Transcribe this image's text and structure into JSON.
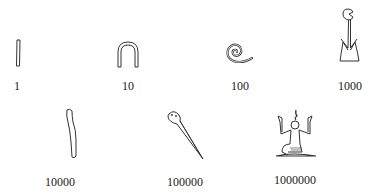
{
  "numerals": [
    {
      "value": "1",
      "glyph": "stroke-icon",
      "description": "single vertical stroke"
    },
    {
      "value": "10",
      "glyph": "heel-bone-icon",
      "description": "hobble / arch"
    },
    {
      "value": "100",
      "glyph": "coil-of-rope-icon",
      "description": "coiled rope spiral"
    },
    {
      "value": "1000",
      "glyph": "lotus-plant-icon",
      "description": "water lily / lotus"
    },
    {
      "value": "10000",
      "glyph": "finger-icon",
      "description": "bent finger"
    },
    {
      "value": "100000",
      "glyph": "tadpole-icon",
      "description": "tadpole / frog"
    },
    {
      "value": "1000000",
      "glyph": "heh-god-icon",
      "description": "kneeling god Heh with raised arms"
    }
  ]
}
